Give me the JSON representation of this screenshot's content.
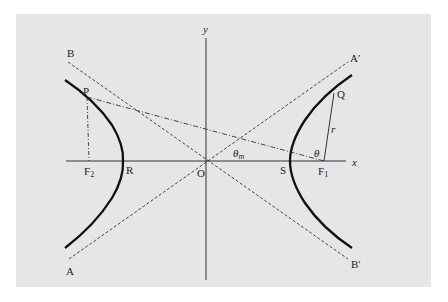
{
  "diagram": {
    "panel_color": "#e6e6e6",
    "axes": {
      "x_label": "x",
      "y_label": "y",
      "origin_label": "O"
    },
    "points": {
      "P": "P",
      "Q": "Q",
      "R": "R",
      "S": "S",
      "F1": "F",
      "F1_sub": "1",
      "F2": "F",
      "F2_sub": "2",
      "A": "A",
      "A_prime": "A′",
      "B": "B",
      "B_prime": "B′"
    },
    "angles": {
      "theta": "θ",
      "theta_m": "θ",
      "theta_m_sub": "m"
    },
    "segment_labels": {
      "r": "r"
    },
    "elements": [
      "left hyperbola branch (bold)",
      "right hyperbola branch (bold)",
      "asymptote A–A′ (dashed)",
      "asymptote B–B′ (dashed)",
      "line P–F1 (dash-dot)",
      "line P–F2 (dash-dot, vertical)",
      "segment F1–Q (solid, length r)"
    ]
  }
}
